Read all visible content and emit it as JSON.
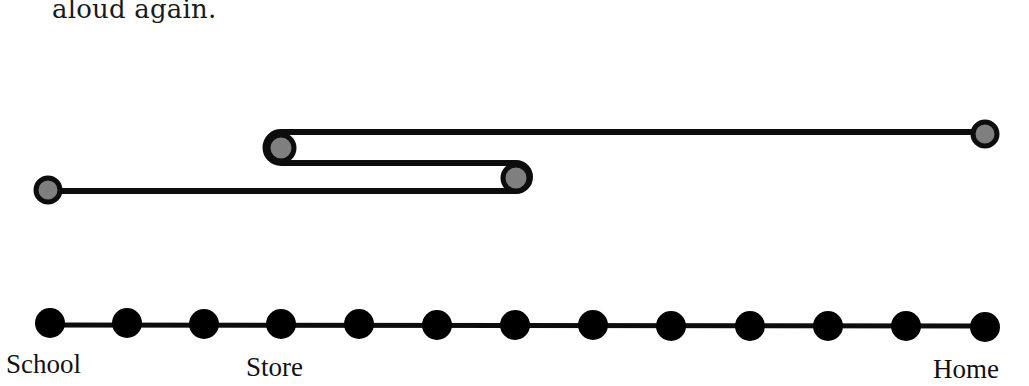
{
  "text": {
    "intro_line": "aloud again."
  },
  "number_line": {
    "tick_count": 13,
    "labels": [
      {
        "text": "School",
        "position_index": 0
      },
      {
        "text": "Store",
        "position_index": 3
      },
      {
        "text": "Home",
        "position_index": 12
      }
    ]
  },
  "path": {
    "description": "Trip diagram: School to position 6, back to Store (position 3), then to Home (position 12)",
    "stops": [
      {
        "position_index": 0,
        "label": "School"
      },
      {
        "position_index": 6,
        "label": ""
      },
      {
        "position_index": 3,
        "label": "Store"
      },
      {
        "position_index": 12,
        "label": "Home"
      }
    ]
  },
  "colors": {
    "line": "#0d0d0d",
    "stop_fill": "#7f7f7f",
    "dot_fill": "#000000"
  }
}
